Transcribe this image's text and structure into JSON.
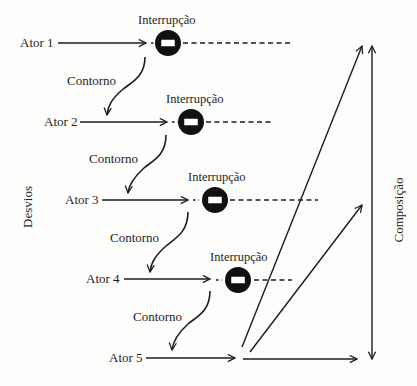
{
  "diagram": {
    "type": "flow-diagram",
    "top_cutoff_text": "",
    "actors": [
      {
        "label": "Ator 1",
        "interruption_label": "Interrupção"
      },
      {
        "label": "Ator 2",
        "interruption_label": "Interrupção"
      },
      {
        "label": "Ator 3",
        "interruption_label": "Interrupção"
      },
      {
        "label": "Ator 4",
        "interruption_label": "Interrupção"
      },
      {
        "label": "Ator 5"
      }
    ],
    "detours": [
      {
        "label": "Contorno"
      },
      {
        "label": "Contorno"
      },
      {
        "label": "Contorno"
      },
      {
        "label": "Contorno"
      }
    ],
    "left_axis_label": "Desvios",
    "right_axis_label": "Composição",
    "icons": {
      "interruption": "no-entry-icon"
    },
    "colors": {
      "ink": "#1c1c1c",
      "background": "#fdfdfc",
      "icon_fill": "#111111",
      "icon_bar": "#ffffff"
    }
  }
}
